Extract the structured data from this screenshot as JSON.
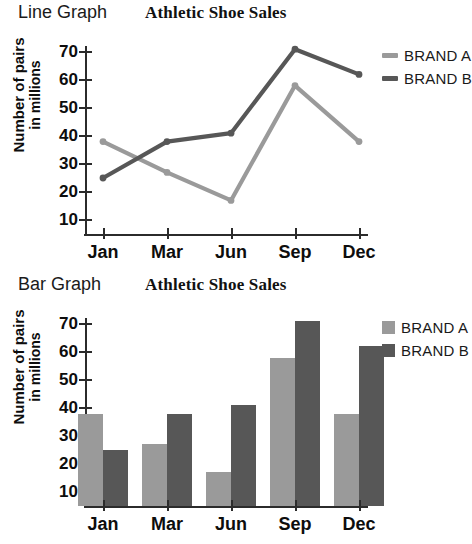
{
  "charts": [
    {
      "kind_label": "Line Graph",
      "title": "Athletic Shoe Sales",
      "ylabel_line1": "Number of pairs",
      "ylabel_line2": "in millions",
      "legend": [
        {
          "label": "BRAND A",
          "color": "#9a9a9a"
        },
        {
          "label": "BRAND B",
          "color": "#575757"
        }
      ],
      "chart_data": {
        "type": "line",
        "title": "Athletic Shoe Sales",
        "xlabel": "",
        "ylabel": "Number of pairs in millions",
        "categories": [
          "Jan",
          "Mar",
          "Jun",
          "Sep",
          "Dec"
        ],
        "yticks": [
          10,
          20,
          30,
          40,
          50,
          60,
          70
        ],
        "ylim": [
          5,
          74
        ],
        "grid": false,
        "legend_position": "right",
        "series": [
          {
            "name": "BRAND A",
            "color": "#9a9a9a",
            "values": [
              38,
              27,
              17,
              58,
              38
            ]
          },
          {
            "name": "BRAND B",
            "color": "#575757",
            "values": [
              25,
              38,
              41,
              71,
              62
            ]
          }
        ]
      }
    },
    {
      "kind_label": "Bar Graph",
      "title": "Athletic Shoe Sales",
      "ylabel_line1": "Number of pairs",
      "ylabel_line2": "in millions",
      "legend": [
        {
          "label": "BRAND A",
          "color": "#9a9a9a"
        },
        {
          "label": "BRAND B",
          "color": "#575757"
        }
      ],
      "chart_data": {
        "type": "bar",
        "title": "Athletic Shoe Sales",
        "xlabel": "",
        "ylabel": "Number of pairs in millions",
        "categories": [
          "Jan",
          "Mar",
          "Jun",
          "Sep",
          "Dec"
        ],
        "yticks": [
          10,
          20,
          30,
          40,
          50,
          60,
          70
        ],
        "ylim": [
          5,
          74
        ],
        "grid": false,
        "legend_position": "right",
        "series": [
          {
            "name": "BRAND A",
            "color": "#9a9a9a",
            "values": [
              38,
              27,
              17,
              58,
              38
            ]
          },
          {
            "name": "BRAND B",
            "color": "#575757",
            "values": [
              25,
              38,
              41,
              71,
              62
            ]
          }
        ]
      }
    }
  ]
}
